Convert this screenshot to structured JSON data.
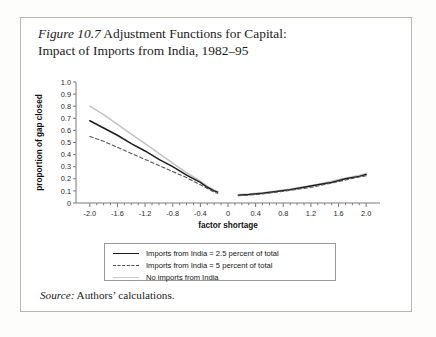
{
  "figure": {
    "label": "Figure 10.7",
    "title_line1": " Adjustment Functions for Capital:",
    "title_line2": "Impact of Imports from India, 1982–95",
    "source_label": "Source:",
    "source_text": " Authors’ calculations."
  },
  "colors": {
    "series_solid": "#1d1d1d",
    "series_dashed": "#555555",
    "series_gray": "#c3c3c3",
    "axis": "#7a7a7a",
    "border": "#b9b9b4"
  },
  "chart_data": {
    "type": "line",
    "title": "Figure 10.7 Adjustment Functions for Capital: Impact of Imports from India, 1982–95",
    "xlabel": "factor shortage",
    "ylabel": "proportion of gap closed",
    "xlim": [
      -2.2,
      2.2
    ],
    "ylim": [
      0,
      1.0
    ],
    "xticks": [
      -2.0,
      -1.6,
      -1.2,
      -0.8,
      -0.4,
      0,
      0.4,
      0.8,
      1.2,
      1.6,
      2.0
    ],
    "xticklabels": [
      "-2.0",
      "-1.6",
      "-1.2",
      "-0.8",
      "-0.4",
      "0",
      "0.4",
      "0.8",
      "1.2",
      "1.6",
      "2.0"
    ],
    "yticks": [
      0,
      0.1,
      0.2,
      0.3,
      0.4,
      0.5,
      0.6,
      0.7,
      0.8,
      0.9,
      1.0
    ],
    "yticklabels": [
      "0",
      "0.1",
      "0.2",
      "0.3",
      "0.4",
      "0.5",
      "0.6",
      "0.7",
      "0.8",
      "0.9",
      "1.0"
    ],
    "minor_tick_step": 0.1,
    "grid": false,
    "legend_position": "below-axes",
    "gap_note": "curves are discontinuous across x=0; left branch ends near x=-0.15, right branch starts near x=0.15",
    "series": [
      {
        "name": "Imports from India = 2.5 percent of total",
        "style": "solid",
        "color": "#1d1d1d",
        "left_branch": {
          "x": [
            -2.0,
            -1.8,
            -1.6,
            -1.4,
            -1.2,
            -1.0,
            -0.8,
            -0.6,
            -0.4,
            -0.3,
            -0.2,
            -0.15
          ],
          "y": [
            0.68,
            0.62,
            0.56,
            0.49,
            0.43,
            0.36,
            0.3,
            0.23,
            0.17,
            0.13,
            0.1,
            0.09
          ]
        },
        "right_branch": {
          "x": [
            0.15,
            0.3,
            0.5,
            0.7,
            0.9,
            1.1,
            1.3,
            1.5,
            1.7,
            1.9,
            2.0
          ],
          "y": [
            0.065,
            0.07,
            0.08,
            0.095,
            0.11,
            0.13,
            0.15,
            0.17,
            0.2,
            0.22,
            0.235
          ]
        }
      },
      {
        "name": "Imports from India = 5 percent of total",
        "style": "dashed",
        "color": "#555555",
        "left_branch": {
          "x": [
            -2.0,
            -1.8,
            -1.6,
            -1.4,
            -1.2,
            -1.0,
            -0.8,
            -0.6,
            -0.4,
            -0.3,
            -0.2,
            -0.15
          ],
          "y": [
            0.55,
            0.51,
            0.46,
            0.41,
            0.36,
            0.31,
            0.26,
            0.21,
            0.15,
            0.12,
            0.09,
            0.08
          ]
        },
        "right_branch": {
          "x": [
            0.15,
            0.3,
            0.5,
            0.7,
            0.9,
            1.1,
            1.3,
            1.5,
            1.7,
            1.9,
            2.0
          ],
          "y": [
            0.06,
            0.065,
            0.075,
            0.09,
            0.105,
            0.12,
            0.14,
            0.165,
            0.19,
            0.215,
            0.225
          ]
        }
      },
      {
        "name": "No imports from India",
        "style": "solid-light",
        "color": "#c3c3c3",
        "left_branch": {
          "x": [
            -2.0,
            -1.8,
            -1.6,
            -1.4,
            -1.2,
            -1.0,
            -0.8,
            -0.6,
            -0.4,
            -0.3,
            -0.2,
            -0.15
          ],
          "y": [
            0.8,
            0.73,
            0.65,
            0.57,
            0.49,
            0.41,
            0.33,
            0.25,
            0.18,
            0.14,
            0.105,
            0.095
          ]
        },
        "right_branch": {
          "x": [
            0.15,
            0.3,
            0.5,
            0.7,
            0.9,
            1.1,
            1.3,
            1.5,
            1.7,
            1.9,
            2.0
          ],
          "y": [
            0.07,
            0.075,
            0.085,
            0.1,
            0.115,
            0.135,
            0.155,
            0.18,
            0.205,
            0.23,
            0.245
          ]
        }
      }
    ]
  },
  "legend": {
    "items": [
      {
        "label": "Imports from India = 2.5 percent of total",
        "style": "solid"
      },
      {
        "label": "Imports from India = 5 percent of total",
        "style": "dashed"
      },
      {
        "label": "No imports from India",
        "style": "solid-light"
      }
    ]
  }
}
